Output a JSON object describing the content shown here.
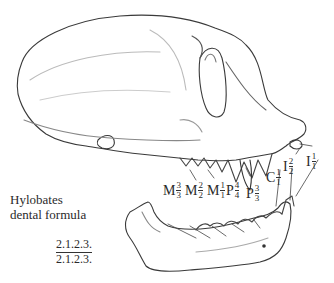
{
  "figure": {
    "caption_line1": "Hylobates",
    "caption_line2": "dental formula",
    "formula": {
      "upper": "2.1.2.3.",
      "lower": "2.1.2.3."
    },
    "teeth_labels": [
      {
        "letter": "M",
        "upper": "3",
        "lower": "3"
      },
      {
        "letter": "M",
        "upper": "2",
        "lower": "2"
      },
      {
        "letter": "M",
        "upper": "1",
        "lower": "1"
      },
      {
        "letter": "P",
        "upper": "4",
        "lower": "4"
      },
      {
        "letter": "P",
        "upper": "3",
        "lower": "3"
      },
      {
        "letter": "C",
        "upper": "1",
        "lower": "1"
      },
      {
        "letter": "I",
        "upper": "2",
        "lower": "2"
      },
      {
        "letter": "I",
        "upper": "1",
        "lower": "1"
      }
    ],
    "colors": {
      "line": "#3a3a3a",
      "shade": "#9a9a9a",
      "background": "#ffffff"
    }
  }
}
